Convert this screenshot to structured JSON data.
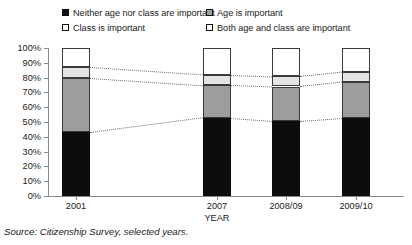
{
  "chart_data": {
    "type": "bar",
    "stacked": true,
    "title": "",
    "xlabel": "YEAR",
    "ylabel": "",
    "ylim": [
      0,
      100
    ],
    "ytick_labels": [
      "100%",
      "90%",
      "80%",
      "70%",
      "60%",
      "50%",
      "40%",
      "30%",
      "20%",
      "10%",
      "0%"
    ],
    "ytick_values": [
      100,
      90,
      80,
      70,
      60,
      50,
      40,
      30,
      20,
      10,
      0
    ],
    "grid": false,
    "legend_position": "top",
    "categories": [
      "2001",
      "2007",
      "2008/09",
      "2009/10"
    ],
    "series": [
      {
        "name": "Neither age nor class are important",
        "color": "#0d0d0d",
        "values": [
          43,
          53,
          51,
          53
        ]
      },
      {
        "name": "Age is important",
        "color": "#9d9d9d",
        "values": [
          37,
          22,
          23,
          24
        ]
      },
      {
        "name": "Class is important",
        "color": "#e4e4e4",
        "values": [
          7,
          7,
          7,
          7
        ]
      },
      {
        "name": "Both age and class are important",
        "color": "#ffffff",
        "values": [
          13,
          18,
          19,
          16
        ]
      }
    ],
    "connectors": true,
    "source_note": "Source: Citizenship Survey, selected years."
  },
  "legend": {
    "items": [
      {
        "label": "Neither age nor class are important",
        "swatch": "black-square-icon"
      },
      {
        "label": "Age is important",
        "swatch": "gray-square-icon"
      },
      {
        "label": "Class is important",
        "swatch": "light-square-icon"
      },
      {
        "label": "Both age and class are important",
        "swatch": "white-square-icon"
      }
    ]
  },
  "axes": {
    "y_labels": [
      "100%",
      "90%",
      "80%",
      "70%",
      "60%",
      "50%",
      "40%",
      "30%",
      "20%",
      "10%",
      "0%"
    ],
    "x_labels": [
      "2001",
      "2007",
      "2008/09",
      "2009/10"
    ],
    "x_title": "YEAR"
  },
  "footer": {
    "source": "Source: Citizenship Survey, selected years."
  }
}
